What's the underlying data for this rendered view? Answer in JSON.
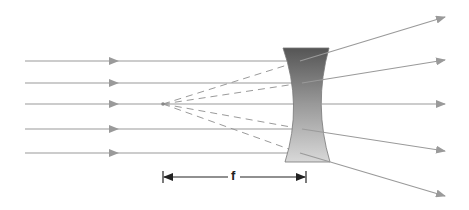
{
  "diagram": {
    "type": "diverging-lens-ray-diagram",
    "lens": {
      "kind": "concave",
      "gradient_top": "#5a5a5a",
      "gradient_bottom": "#d4d4d4"
    },
    "focal_label": "f",
    "colors": {
      "ray": "#9a9a9a",
      "dashed": "#9a9a9a",
      "dimension": "#222222"
    },
    "incident_rays": [
      {
        "y": 61
      },
      {
        "y": 83
      },
      {
        "y": 104
      },
      {
        "y": 129
      },
      {
        "y": 153
      }
    ],
    "refracted_rays": [
      {
        "from": [
          310,
          61
        ],
        "to": [
          445,
          17
        ]
      },
      {
        "from": [
          310,
          83
        ],
        "to": [
          445,
          60
        ]
      },
      {
        "from": [
          310,
          104
        ],
        "to": [
          445,
          104
        ]
      },
      {
        "from": [
          310,
          129
        ],
        "to": [
          445,
          151
        ]
      },
      {
        "from": [
          310,
          153
        ],
        "to": [
          445,
          196
        ]
      }
    ],
    "focal_point": [
      163,
      104
    ]
  }
}
